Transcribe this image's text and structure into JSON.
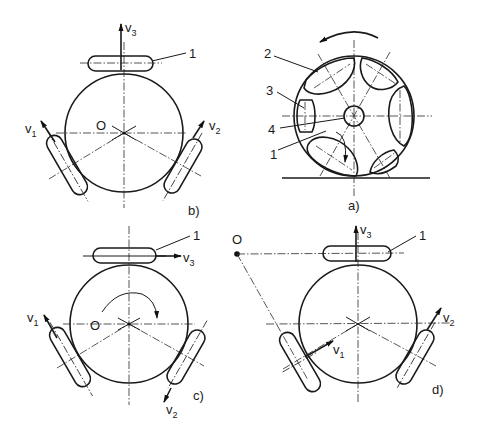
{
  "figure": {
    "panels": [
      {
        "id": "b",
        "caption": "b)",
        "center_label": "O",
        "part_label": "1",
        "velocities": [
          "v1",
          "v2",
          "v3"
        ]
      },
      {
        "id": "a",
        "caption": "a)",
        "part_labels": [
          "2",
          "3",
          "4",
          "1"
        ]
      },
      {
        "id": "c",
        "caption": "c)",
        "center_label": "O",
        "part_label": "1",
        "velocities": [
          "v1",
          "v2",
          "v3"
        ]
      },
      {
        "id": "d",
        "caption": "d)",
        "center_label": "O",
        "part_label": "1",
        "velocities": [
          "v1",
          "v2",
          "v3"
        ]
      }
    ],
    "glyphs": {
      "v": "v",
      "sub1": "1",
      "sub2": "2",
      "sub3": "3"
    },
    "colors": {
      "ink": "#1a1a1a",
      "paper": "#ffffff"
    }
  }
}
